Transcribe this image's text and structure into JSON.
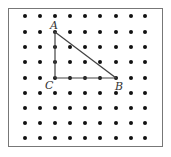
{
  "grid": {
    "columns": 9,
    "rows": 9,
    "x_positions": [
      25,
      40,
      55,
      70,
      85,
      100,
      116,
      131,
      145
    ],
    "y_positions": [
      16,
      32,
      47,
      62,
      78,
      93,
      108,
      123,
      138
    ],
    "dot_color": "#111111",
    "dot_radius": 2
  },
  "triangle": {
    "line_color": "#444444",
    "vertices": [
      {
        "label": "A",
        "x": 55,
        "y": 32,
        "label_x": 50,
        "label_y": 29
      },
      {
        "label": "B",
        "x": 116,
        "y": 78,
        "label_x": 115,
        "label_y": 90
      },
      {
        "label": "C",
        "x": 55,
        "y": 78,
        "label_x": 45,
        "label_y": 89
      }
    ]
  }
}
